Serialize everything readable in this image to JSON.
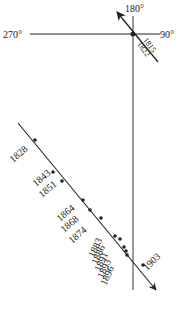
{
  "axes": {
    "top_label": "180°",
    "left_label": "270°",
    "right_label": "90°"
  },
  "upper_years": [
    "1815",
    "1822"
  ],
  "lower_years": {
    "left": [
      "1828",
      "1843",
      "1851",
      "1864",
      "1868",
      "1874"
    ],
    "stacked": [
      "1883",
      "1886",
      "1891",
      "1893",
      "1896"
    ],
    "right": "1903"
  },
  "colors": {
    "line": "#222222",
    "background": "#ffffff"
  }
}
